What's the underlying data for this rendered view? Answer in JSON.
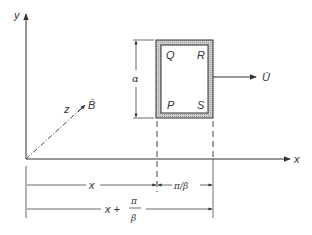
{
  "diagram": {
    "axes": {
      "x_label": "x",
      "y_label": "y",
      "z_label": "z"
    },
    "vectors": {
      "magnetic_field": "B̄",
      "velocity": "Ū"
    },
    "loop": {
      "corners": {
        "top_left": "Q",
        "top_right": "R",
        "bottom_left": "P",
        "bottom_right": "S"
      },
      "height_label": "α"
    },
    "dimensions": {
      "position_label": "x",
      "width_label": "π/β",
      "far_edge_label_left": "x +",
      "far_edge_frac_num": "π",
      "far_edge_frac_den": "β"
    },
    "colors": {
      "line": "#333333",
      "loop_hatch": "#bdbdbd",
      "background": "#ffffff"
    }
  }
}
